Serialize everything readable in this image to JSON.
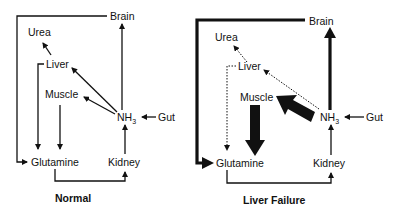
{
  "panels": [
    {
      "caption": "Normal",
      "nodes": {
        "brain": "Brain",
        "urea": "Urea",
        "liver": "Liver",
        "muscle": "Muscle",
        "nh3": "NH",
        "nh3_sub": "3",
        "gut": "Gut",
        "glutamine": "Glutamine",
        "kidney": "Kidney"
      }
    },
    {
      "caption": "Liver Failure",
      "nodes": {
        "brain": "Brain",
        "urea": "Urea",
        "liver": "Liver",
        "muscle": "Muscle",
        "nh3": "NH",
        "nh3_sub": "3",
        "gut": "Gut",
        "glutamine": "Glutamine",
        "kidney": "Kidney"
      }
    }
  ],
  "colors": {
    "ink": "#111111",
    "background": "#ffffff"
  }
}
